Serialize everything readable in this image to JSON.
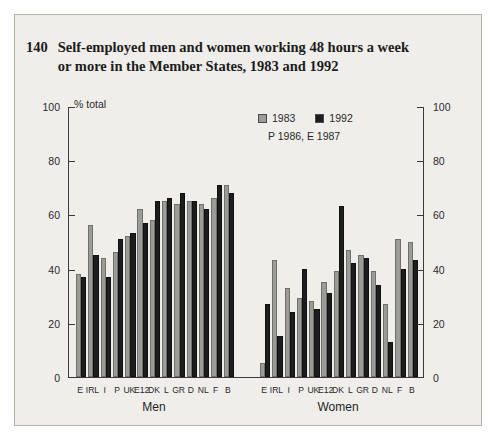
{
  "figure": {
    "number": "140",
    "title": "Self-employed men and women working 48 hours a week or more in the Member States, 1983 and 1992"
  },
  "legend": {
    "items": [
      {
        "label": "1983",
        "color": "#9b9b98"
      },
      {
        "label": "1992",
        "color": "#1d1d1d"
      }
    ],
    "note": "P 1986, E 1987"
  },
  "axis": {
    "unit_label": "% total",
    "ticks": [
      "0",
      "20",
      "40",
      "60",
      "80",
      "100"
    ],
    "left_ticks": [
      "100",
      "80",
      "60",
      "40",
      "20",
      "0"
    ],
    "right_ticks": [
      "100",
      "80",
      "60",
      "40",
      "20",
      "0"
    ]
  },
  "groups": [
    {
      "name": "Men"
    },
    {
      "name": "Women"
    }
  ],
  "chart_data": {
    "type": "bar",
    "title": "Self-employed men and women working 48 hours a week or more in the Member States, 1983 and 1992",
    "subtitle": "P 1986, E 1987",
    "xlabel": "",
    "ylabel": "% total",
    "ylim": [
      0,
      100
    ],
    "ytick_step": 20,
    "grid": false,
    "legend_position": "top-right",
    "panels": [
      {
        "name": "Men",
        "categories": [
          "E",
          "IRL",
          "I",
          "P",
          "UK",
          "E12",
          "DK",
          "L",
          "GR",
          "D",
          "NL",
          "F",
          "B"
        ],
        "series": [
          {
            "name": "1983",
            "color": "#9b9b98",
            "values": [
              38,
              56,
              44,
              46,
              52,
              62,
              58,
              65,
              64,
              65,
              64,
              66,
              71
            ]
          },
          {
            "name": "1992",
            "color": "#1d1d1d",
            "values": [
              37,
              45,
              37,
              51,
              53,
              57,
              65,
              66,
              68,
              65,
              62,
              71,
              68
            ]
          }
        ]
      },
      {
        "name": "Women",
        "categories": [
          "E",
          "IRL",
          "I",
          "P",
          "UK",
          "E12",
          "DK",
          "L",
          "GR",
          "D",
          "NL",
          "F",
          "B"
        ],
        "series": [
          {
            "name": "1983",
            "color": "#9b9b98",
            "values": [
              5,
              43,
              33,
              29,
              28,
              35,
              39,
              47,
              45,
              39,
              27,
              51,
              50
            ]
          },
          {
            "name": "1992",
            "color": "#1d1d1d",
            "values": [
              27,
              15,
              24,
              40,
              25,
              31,
              63,
              42,
              44,
              34,
              13,
              40,
              43
            ]
          }
        ]
      }
    ]
  }
}
